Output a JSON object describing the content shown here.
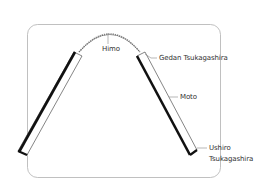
{
  "diagram": {
    "type": "labeled illustration",
    "colors": {
      "stroke": "#222222",
      "frame": "#aaaaaa",
      "leader": "#777777",
      "text": "#333333",
      "background": "#ffffff"
    },
    "labels": {
      "himo": "Himo",
      "gedan": "Gedan Tsukagashira",
      "moto": "Moto",
      "ushiro_line1": "Ushiro",
      "ushiro_line2": "Tsukagashira"
    }
  }
}
